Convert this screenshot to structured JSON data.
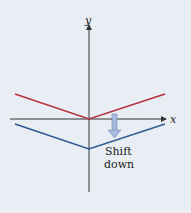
{
  "diagram": {
    "axes": {
      "x_label": "x",
      "y_label": "y"
    },
    "graphs": [
      {
        "name": "original",
        "color": "#b5323d",
        "points": [
          [
            15,
            94
          ],
          [
            89,
            119
          ],
          [
            165,
            94
          ]
        ]
      },
      {
        "name": "shifted",
        "color": "#2f5a93",
        "points": [
          [
            15,
            124
          ],
          [
            89,
            149
          ],
          [
            165,
            124
          ]
        ]
      }
    ],
    "annotation": {
      "line1": "Shift",
      "line2": "down",
      "arrow_color": "#8fa6cf"
    },
    "background": "#e9eef4"
  }
}
